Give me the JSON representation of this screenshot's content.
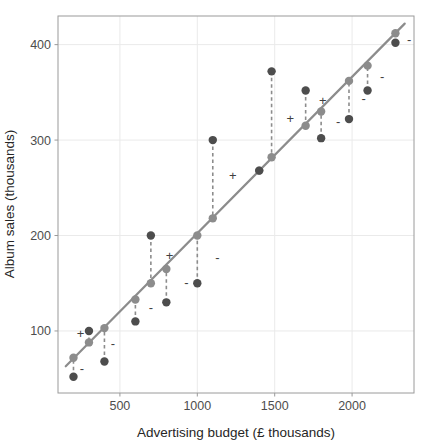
{
  "chart_data": {
    "type": "scatter",
    "title": "",
    "xlabel": "Advertising budget (£ thousands)",
    "ylabel": "Album sales (thousands)",
    "xlim": [
      100,
      2400
    ],
    "ylim": [
      35,
      430
    ],
    "xticks": [
      500,
      1000,
      1500,
      2000
    ],
    "xticklabels": [
      "500",
      "1000",
      "1500",
      "2000"
    ],
    "yticks": [
      100,
      200,
      300,
      400
    ],
    "yticklabels": [
      "100",
      "200",
      "300",
      "400"
    ],
    "grid": true,
    "legend": "none",
    "series": [
      {
        "name": "Observed",
        "marker": "filled-circle",
        "color": "#4d4d4d",
        "x": [
          200,
          300,
          400,
          600,
          700,
          800,
          1000,
          1100,
          1400,
          1480,
          1700,
          1800,
          1980,
          2100,
          2280
        ],
        "values": [
          52,
          100,
          68,
          110,
          200,
          130,
          150,
          300,
          268,
          372,
          352,
          302,
          322,
          352,
          402
        ]
      },
      {
        "name": "Fitted (model)",
        "marker": "filled-circle",
        "color": "#8c8c8c",
        "x": [
          200,
          300,
          400,
          600,
          700,
          800,
          1000,
          1100,
          1400,
          1480,
          1700,
          1800,
          1980,
          2100,
          2280
        ],
        "values": [
          72,
          88,
          103,
          133,
          150,
          165,
          200,
          218,
          268,
          282,
          315,
          330,
          362,
          378,
          412
        ]
      }
    ],
    "residual_signs": [
      {
        "x": 200,
        "sign": "-",
        "label_x": 255,
        "label_y": 60
      },
      {
        "x": 300,
        "sign": "+",
        "label_x": 245,
        "label_y": 96
      },
      {
        "x": 400,
        "sign": "-",
        "label_x": 455,
        "label_y": 86
      },
      {
        "x": 600,
        "sign": "-",
        "label_x": 700,
        "label_y": 123
      },
      {
        "x": 700,
        "sign": "+",
        "label_x": 820,
        "label_y": 178
      },
      {
        "x": 800,
        "sign": "-",
        "label_x": 930,
        "label_y": 150
      },
      {
        "x": 1000,
        "sign": "-",
        "label_x": 1130,
        "label_y": 176
      },
      {
        "x": 1100,
        "sign": "+",
        "label_x": 1230,
        "label_y": 262
      },
      {
        "x": 1480,
        "sign": "+",
        "label_x": 1600,
        "label_y": 322
      },
      {
        "x": 1700,
        "sign": "+",
        "label_x": 1810,
        "label_y": 340
      },
      {
        "x": 1800,
        "sign": "-",
        "label_x": 1910,
        "label_y": 318
      },
      {
        "x": 1980,
        "sign": "-",
        "label_x": 2075,
        "label_y": 342
      },
      {
        "x": 2100,
        "sign": "-",
        "label_x": 2195,
        "label_y": 366
      },
      {
        "x": 2280,
        "sign": "-",
        "label_x": 2368,
        "label_y": 404
      }
    ],
    "regression_line": {
      "color": "#8c8c8c",
      "x1": 150,
      "y1": 63,
      "x2": 2340,
      "y2": 422
    },
    "colors": {
      "observed_point": "#4d4d4d",
      "fitted_point": "#8c8c8c",
      "line": "#8c8c8c",
      "residual_segment": "#8c8c8c",
      "panel_border": "#9a9a9a",
      "grid_major": "#eaeaea",
      "panel_background": "#ffffff",
      "text": "#262626",
      "tick_text": "#4d4d4d"
    }
  }
}
